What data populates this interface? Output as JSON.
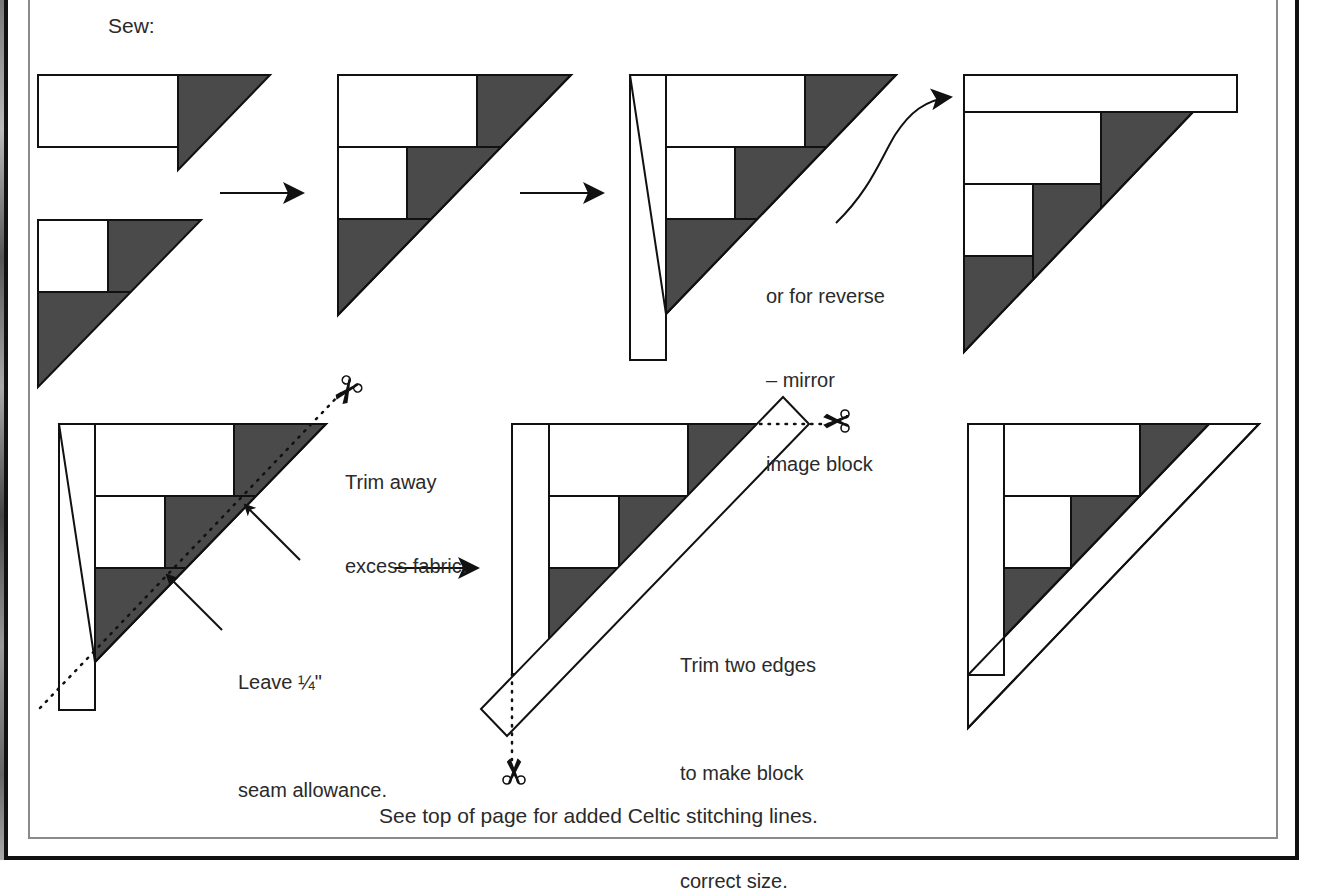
{
  "page": {
    "intro_label": "Sew:",
    "caption": "See top of page for added Celtic stitching lines.",
    "colors": {
      "fabric_dark": "#4a4a4a",
      "fabric_light": "#ffffff",
      "outline": "#111111",
      "outer_frame": "#111111",
      "inner_frame": "#8a8a8a",
      "text": "#2a2a2a"
    }
  },
  "steps": [
    {
      "id": 1,
      "title": "Step 1 pieces"
    },
    {
      "id": 2,
      "title": "Step 2 joined block"
    },
    {
      "id": 3,
      "title": "Step 3 add side strip"
    },
    {
      "id": 4,
      "title": "Step 4 reverse (mirror image) block"
    },
    {
      "id": 5,
      "title": "Step 5 trim excess"
    },
    {
      "id": 6,
      "title": "Step 6 add diagonal strip and trim"
    },
    {
      "id": 7,
      "title": "Step 7 finished block"
    }
  ],
  "annotations": {
    "reverse": [
      "or for reverse",
      "– mirror",
      "image block"
    ],
    "trim_away": [
      "Trim away",
      "excess fabric."
    ],
    "seam": [
      "Leave ¼\"",
      "seam allowance."
    ],
    "trim_edges": [
      "Trim two edges",
      "to make block",
      "correct size."
    ]
  },
  "icons": {
    "scissors": "scissors-icon",
    "arrow": "arrow-right-icon",
    "curved_arrow": "curved-arrow-icon"
  }
}
